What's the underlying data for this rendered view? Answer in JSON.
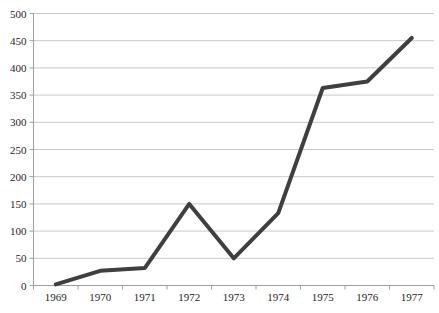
{
  "chart_data": {
    "type": "line",
    "title": "",
    "subtitle": "",
    "xlabel": "",
    "ylabel": "",
    "categories": [
      "1969",
      "1970",
      "1971",
      "1972",
      "1973",
      "1974",
      "1975",
      "1976",
      "1977"
    ],
    "series": [
      {
        "name": "series-1",
        "values": [
          2,
          27,
          32,
          150,
          50,
          133,
          363,
          375,
          455
        ]
      }
    ],
    "ylim": [
      0,
      500
    ],
    "y_ticks": [
      0,
      50,
      100,
      150,
      200,
      250,
      300,
      350,
      400,
      450,
      500
    ],
    "grid": "horizontal",
    "legend_position": "none",
    "colors": {
      "line": "#3f3f3f",
      "gridline": "#c9c9c9",
      "axis": "#9e9e9e",
      "tick_text": "#262626",
      "background": "#ffffff"
    }
  }
}
